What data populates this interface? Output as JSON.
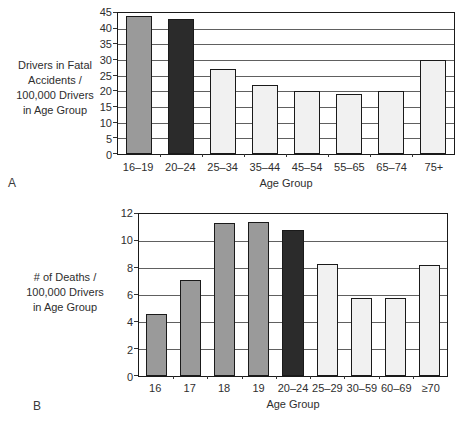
{
  "colors": {
    "background": "#ffffff",
    "plot_border": "#1a1a1a",
    "gridline": "#606060",
    "bar_border": "#1a1a1a",
    "bar_medium_gray": "#9a9a9a",
    "bar_dark": "#2b2b2b",
    "bar_light": "#f1f1f1",
    "text": "#2e2e2e"
  },
  "figure": {
    "panel_a": {
      "panel_label": "A",
      "ylabel_lines": [
        "Drivers in Fatal",
        "Accidents /",
        "100,000 Drivers",
        "in Age Group"
      ],
      "xlabel": "Age Group"
    },
    "panel_b": {
      "panel_label": "B",
      "ylabel_lines": [
        "# of Deaths /",
        "100,000 Drivers",
        "in Age Group"
      ],
      "xlabel": "Age Group"
    }
  },
  "chart_data": [
    {
      "type": "bar",
      "panel": "A",
      "title": "",
      "categories": [
        "16–19",
        "20–24",
        "25–34",
        "35–44",
        "45–54",
        "55–65",
        "65–74",
        "75+"
      ],
      "values": [
        44,
        43,
        27,
        22,
        20,
        19,
        20,
        30
      ],
      "xlabel": "Age Group",
      "ylabel": "Drivers in Fatal Accidents / 100,000 Drivers in Age Group",
      "ylim": [
        0,
        45
      ],
      "yticks": [
        0,
        5,
        10,
        15,
        20,
        25,
        30,
        35,
        40,
        45
      ],
      "grid": true,
      "legend_position": "none",
      "bar_colors": [
        "#9a9a9a",
        "#2b2b2b",
        "#f1f1f1",
        "#f1f1f1",
        "#f1f1f1",
        "#f1f1f1",
        "#f1f1f1",
        "#f1f1f1"
      ],
      "bar_width_pct": 60
    },
    {
      "type": "bar",
      "panel": "B",
      "title": "",
      "categories": [
        "16",
        "17",
        "18",
        "19",
        "20–24",
        "25–29",
        "30–59",
        "60–69",
        "≥70"
      ],
      "values": [
        4.6,
        7.1,
        11.3,
        11.4,
        10.8,
        8.3,
        5.8,
        5.8,
        8.2
      ],
      "xlabel": "Age Group",
      "ylabel": "# of Deaths / 100,000 Drivers in Age Group",
      "ylim": [
        0,
        12
      ],
      "yticks": [
        0,
        2,
        4,
        6,
        8,
        10,
        12
      ],
      "grid": true,
      "legend_position": "none",
      "bar_colors": [
        "#9a9a9a",
        "#9a9a9a",
        "#9a9a9a",
        "#9a9a9a",
        "#2b2b2b",
        "#f1f1f1",
        "#f1f1f1",
        "#f1f1f1",
        "#f1f1f1"
      ],
      "bar_width_pct": 62
    }
  ]
}
